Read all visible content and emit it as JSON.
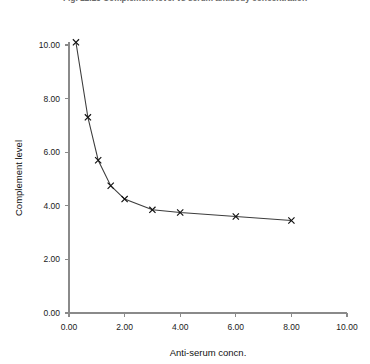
{
  "chart_data": {
    "type": "line",
    "title": "Fig. 12.13  Complement level vs serum antibody concentration",
    "xlabel": "Anti-serum concn.",
    "ylabel": "Complement level",
    "xlim": [
      0,
      10
    ],
    "ylim": [
      0,
      10
    ],
    "xticks": [
      0,
      2,
      4,
      6,
      8,
      10
    ],
    "yticks": [
      0,
      2,
      4,
      6,
      8,
      10
    ],
    "xtick_labels": [
      "0.00",
      "2.00",
      "4.00",
      "6.00",
      "8.00",
      "10.00"
    ],
    "ytick_labels": [
      "0.00",
      "2.00",
      "4.00",
      "6.00",
      "8.00",
      "10.00"
    ],
    "grid": false,
    "legend": "none",
    "marker": "x",
    "line_color": "#3c3c3c",
    "marker_color": "#111111",
    "axis_color": "#8a8a8a",
    "background_color": "#ffffff",
    "x": [
      0.25,
      0.68,
      1.05,
      1.5,
      2.0,
      3.0,
      4.0,
      6.0,
      8.0
    ],
    "y": [
      10.1,
      7.3,
      5.7,
      4.75,
      4.25,
      3.85,
      3.75,
      3.6,
      3.45
    ],
    "series": [
      {
        "name": "Complement level",
        "points": [
          {
            "x": 0.25,
            "y": 10.1
          },
          {
            "x": 0.68,
            "y": 7.3
          },
          {
            "x": 1.05,
            "y": 5.7
          },
          {
            "x": 1.5,
            "y": 4.75
          },
          {
            "x": 2.0,
            "y": 4.25
          },
          {
            "x": 3.0,
            "y": 3.85
          },
          {
            "x": 4.0,
            "y": 3.75
          },
          {
            "x": 6.0,
            "y": 3.6
          },
          {
            "x": 8.0,
            "y": 3.45
          }
        ]
      }
    ]
  }
}
